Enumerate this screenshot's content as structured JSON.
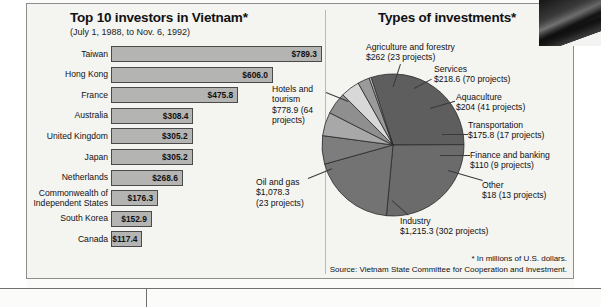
{
  "figure": {
    "footnote": "* In millions of U.S. dollars.",
    "source": "Source: Vietnam State Committee for Cooperation and Investment."
  },
  "chart_data": [
    {
      "type": "bar",
      "title": "Top 10 investors in Vietnam*",
      "subtitle": "(July 1, 1988, to Nov. 6, 1992)",
      "orientation": "horizontal",
      "xlabel": "",
      "ylabel": "",
      "unit": "millions of U.S. dollars",
      "xlim": [
        0,
        789.3
      ],
      "grid": false,
      "legend": "none",
      "categories": [
        "Taiwan",
        "Hong Kong",
        "France",
        "Australia",
        "United Kingdom",
        "Japan",
        "Netherlands",
        "Commonwealth of Independent States",
        "South Korea",
        "Canada"
      ],
      "values": [
        789.3,
        606.0,
        475.8,
        308.4,
        305.2,
        305.2,
        268.6,
        176.3,
        152.9,
        117.4
      ],
      "value_labels": [
        "$789.3",
        "$606.0",
        "$475.8",
        "$308.4",
        "$305.2",
        "$305.2",
        "$268.6",
        "$176.3",
        "$152.9",
        "$117.4"
      ]
    },
    {
      "type": "pie",
      "title": "Types of investments*",
      "unit": "millions of U.S. dollars",
      "legend": "callout-labels",
      "slices": [
        {
          "name": "Industry",
          "value": 1215.3,
          "projects": 302,
          "label": "Industry\n$1,215.3 (302 projects)",
          "color": "#5e5e5e"
        },
        {
          "name": "Oil and gas",
          "value": 1078.3,
          "projects": 23,
          "label": "Oil and gas\n$1,078.3\n(23 projects)",
          "color": "#6b6b6b"
        },
        {
          "name": "Hotels and tourism",
          "value": 778.9,
          "projects": 64,
          "label": "Hotels and\ntourism\n$778.9 (64\nprojects)",
          "color": "#737373"
        },
        {
          "name": "Agriculture and forestry",
          "value": 262,
          "projects": 23,
          "label": "Agriculture and forestry\n$262 (23 projects)",
          "color": "#7d7d7d"
        },
        {
          "name": "Services",
          "value": 218.6,
          "projects": 70,
          "label": "Services\n$218.6 (70 projects)",
          "color": "#a8a8a8"
        },
        {
          "name": "Aquaculture",
          "value": 204,
          "projects": 41,
          "label": "Aquaculture\n$204 (41 projects)",
          "color": "#8f8f8f"
        },
        {
          "name": "Transportation",
          "value": 175.8,
          "projects": 17,
          "label": "Transportation\n$175.8 (17 projects)",
          "color": "#d8d8d8"
        },
        {
          "name": "Finance and banking",
          "value": 110,
          "projects": 9,
          "label": "Finance and banking\n$110 (9 projects)",
          "color": "#9a9a9a"
        },
        {
          "name": "Other",
          "value": 18,
          "projects": 13,
          "label": "Other\n$18 (13 projects)",
          "color": "#c4c4c4"
        }
      ]
    }
  ]
}
